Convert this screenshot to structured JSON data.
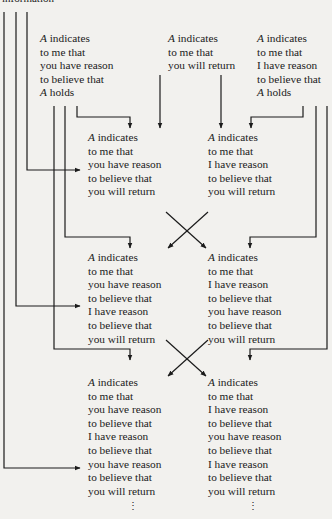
{
  "header": {
    "text": "information"
  },
  "blocks": {
    "top_left": {
      "lines": [
        "A indicates",
        "to me that",
        "you have reason",
        "to believe that",
        "A holds"
      ]
    },
    "top_mid": {
      "lines": [
        "A indicates",
        "to me that",
        "you will return"
      ]
    },
    "top_right": {
      "lines": [
        "A indicates",
        "to me that",
        "I have reason",
        "to believe that",
        "A holds"
      ]
    },
    "r1_left": {
      "lines": [
        "A indicates",
        "to me that",
        "you have reason",
        "to believe that",
        "you will return"
      ]
    },
    "r1_right": {
      "lines": [
        "A indicates",
        "to me that",
        "I have reason",
        "to believe that",
        "you will return"
      ]
    },
    "r2_left": {
      "lines": [
        "A indicates",
        "to me that",
        "you have reason",
        "to believe that",
        "I have reason",
        "to believe that",
        "you will return"
      ]
    },
    "r2_right": {
      "lines": [
        "A indicates",
        "to me that",
        "I have reason",
        "to believe that",
        "you have reason",
        "to believe that",
        "you will return"
      ]
    },
    "r3_left": {
      "lines": [
        "A indicates",
        "to me that",
        "you have reason",
        "to believe that",
        "I have reason",
        "to believe that",
        "you have reason",
        "to believe that",
        "you will return"
      ]
    },
    "r3_right": {
      "lines": [
        "A indicates",
        "to me that",
        "I have reason",
        "to believe that",
        "you have reason",
        "to believe that",
        "I have reason",
        "to believe that",
        "you will return"
      ]
    }
  },
  "continuation": {
    "symbol": "⋮"
  },
  "colors": {
    "ink": "#1b1b1b",
    "paper": "#f2f1ee"
  }
}
